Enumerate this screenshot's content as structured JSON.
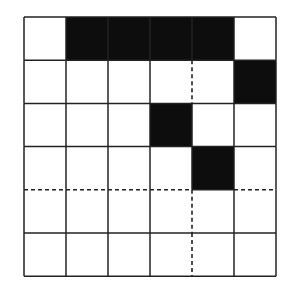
{
  "diagram": {
    "title": "",
    "rows": 6,
    "cols": 6,
    "origin": [
      24,
      17
    ],
    "cell_w": 42,
    "cell_h": 43.2,
    "fill_color": "#0d0d0d",
    "line_color": "#222222",
    "background": "#ffffff",
    "filled_cells": [
      [
        0,
        1
      ],
      [
        0,
        2
      ],
      [
        0,
        3
      ],
      [
        0,
        4
      ],
      [
        1,
        5
      ],
      [
        2,
        3
      ],
      [
        3,
        4
      ]
    ],
    "dashed_segments": [
      {
        "orientation": "vertical",
        "col_line": 4,
        "from_row": 1,
        "to_row": 2
      },
      {
        "orientation": "horizontal",
        "row_line": 4,
        "from_col": 0,
        "to_col": 4
      },
      {
        "orientation": "horizontal",
        "row_line": 4,
        "from_col": 5,
        "to_col": 6
      },
      {
        "orientation": "vertical",
        "col_line": 4,
        "from_row": 4,
        "to_row": 6
      }
    ]
  }
}
